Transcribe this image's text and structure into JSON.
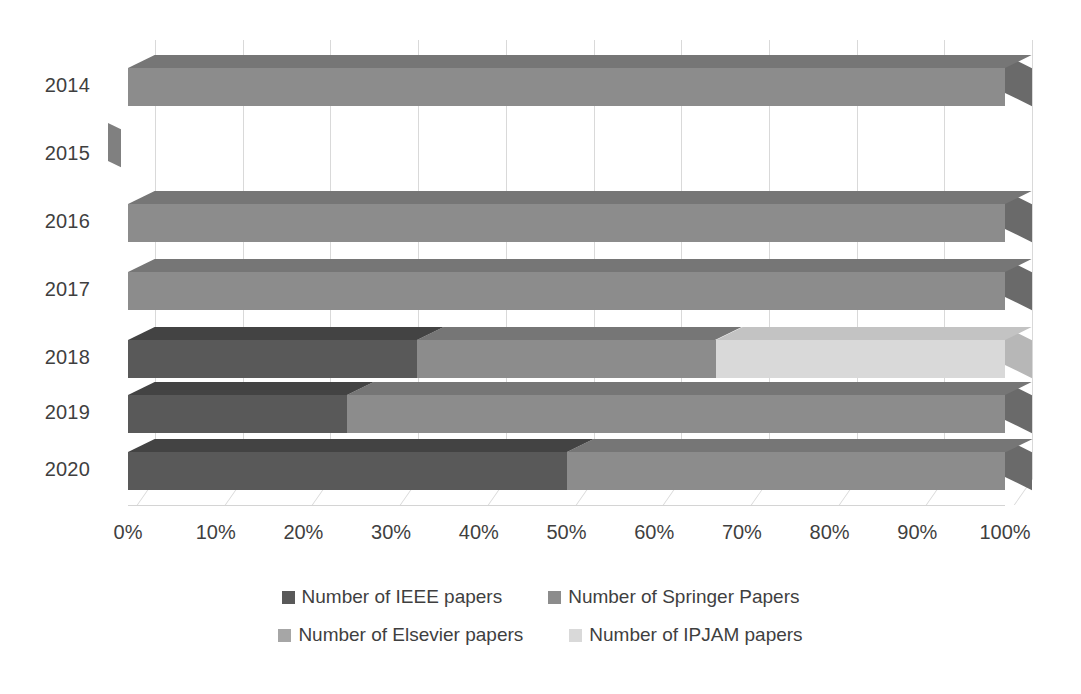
{
  "chart_data": {
    "type": "bar",
    "subtype": "100-percent-stacked-horizontal-3d",
    "title": "",
    "xlabel": "",
    "ylabel": "",
    "orientation": "horizontal",
    "stacked": true,
    "grid": true,
    "legend_position": "bottom",
    "xlim": [
      0,
      100
    ],
    "categories": [
      "2014",
      "2015",
      "2016",
      "2017",
      "2018",
      "2019",
      "2020"
    ],
    "tick_labels": [
      "0%",
      "10%",
      "20%",
      "30%",
      "40%",
      "50%",
      "60%",
      "70%",
      "80%",
      "90%",
      "100%"
    ],
    "tick_values": [
      0,
      10,
      20,
      30,
      40,
      50,
      60,
      70,
      80,
      90,
      100
    ],
    "series": [
      {
        "name": "Number of IEEE papers",
        "color": "#595959",
        "values": [
          0,
          0,
          0,
          0,
          33,
          25,
          50
        ]
      },
      {
        "name": "Number of Springer Papers",
        "color": "#8c8c8c",
        "values": [
          100,
          0,
          100,
          100,
          34,
          75,
          50
        ]
      },
      {
        "name": "Number of Elsevier papers",
        "color": "#a6a6a6",
        "values": [
          0,
          0,
          0,
          0,
          0,
          0,
          0
        ]
      },
      {
        "name": "Number of IPJAM papers",
        "color": "#d9d9d9",
        "values": [
          0,
          0,
          0,
          0,
          33,
          0,
          0
        ]
      }
    ]
  },
  "legend": {
    "items": [
      {
        "label": "Number of IEEE papers",
        "color": "#595959"
      },
      {
        "label": "Number of Springer Papers",
        "color": "#8c8c8c"
      },
      {
        "label": "Number of Elsevier papers",
        "color": "#a6a6a6"
      },
      {
        "label": "Number of IPJAM papers",
        "color": "#d9d9d9"
      }
    ]
  },
  "axis": {
    "x_ticks": [
      "0%",
      "10%",
      "20%",
      "30%",
      "40%",
      "50%",
      "60%",
      "70%",
      "80%",
      "90%",
      "100%"
    ],
    "y_categories": [
      "2014",
      "2015",
      "2016",
      "2017",
      "2018",
      "2019",
      "2020"
    ]
  },
  "colors": {
    "grid": "#d9d9d9",
    "text": "#3f3f3f",
    "background": "#ffffff"
  }
}
